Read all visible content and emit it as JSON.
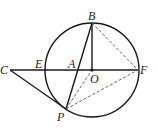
{
  "figure": {
    "type": "geometry",
    "circle": {
      "center": "O",
      "cx": 92,
      "cy": 70,
      "r": 47
    },
    "points": {
      "B": {
        "label": "B",
        "x": 92,
        "y": 23
      },
      "O": {
        "label": "O",
        "x": 92,
        "y": 70
      },
      "F": {
        "label": "F",
        "x": 138,
        "y": 70
      },
      "A": {
        "label": "A",
        "x": 77,
        "y": 70
      },
      "E": {
        "label": "E",
        "x": 45,
        "y": 70
      },
      "C": {
        "label": "C",
        "x": 10,
        "y": 70
      },
      "P": {
        "label": "P",
        "x": 66,
        "y": 109
      }
    },
    "solid_segments": [
      "CF",
      "CP",
      "BP",
      "BO"
    ],
    "dashed_segments": [
      "BF",
      "PO",
      "PF"
    ]
  }
}
